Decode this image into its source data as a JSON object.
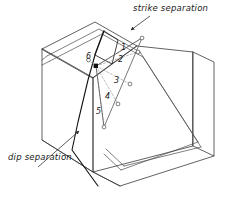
{
  "figure": {
    "type": "geologic-block-diagram",
    "title_visible": false,
    "background_color": "#ffffff",
    "line_color": "#2b2b2b",
    "thin_line_color": "#6e6e6e",
    "dashed_line_color": "#8a8a8a"
  },
  "annotations": {
    "strike_label": "strike separation",
    "dip_label": "dip separation"
  },
  "separation_vectors": {
    "origin_label": "6",
    "items": [
      {
        "id": "1",
        "label": "1"
      },
      {
        "id": "2",
        "label": "2"
      },
      {
        "id": "3",
        "label": "3"
      },
      {
        "id": "4",
        "label": "4"
      },
      {
        "id": "5",
        "label": "5"
      },
      {
        "id": "6",
        "label": "6"
      }
    ]
  },
  "icons": {
    "strike_arrow": "arrow-icon",
    "dip_arrow": "arrow-icon",
    "origin_marker": "filled-square-marker",
    "endpoint_marker": "open-circle-marker"
  }
}
